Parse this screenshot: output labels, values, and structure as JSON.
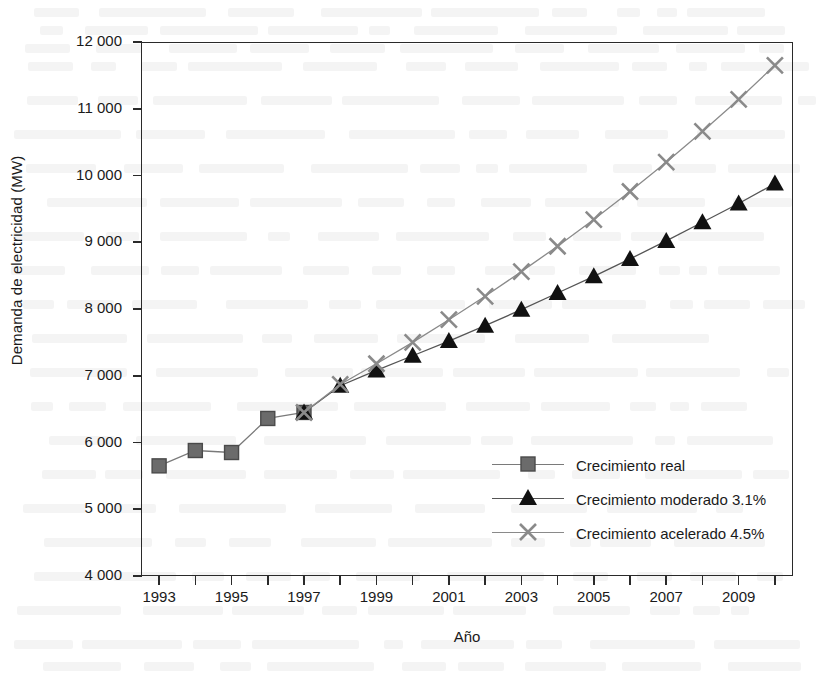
{
  "chart_data": {
    "type": "line",
    "title": "",
    "xlabel": "Año",
    "ylabel": "Demanda de electricidad (MW)",
    "xlim": [
      1992.5,
      2010.5
    ],
    "ylim": [
      4000,
      12000
    ],
    "grid": false,
    "legend_position": "inside-bottom-right",
    "y_ticks": [
      4000,
      5000,
      6000,
      7000,
      8000,
      9000,
      10000,
      11000,
      12000
    ],
    "y_tick_labels": [
      "4 000",
      "5 000",
      "6 000",
      "7 000",
      "8 000",
      "9 000",
      "10 000",
      "11 000",
      "12 000"
    ],
    "x_ticks": [
      1993,
      1994,
      1995,
      1996,
      1997,
      1998,
      1999,
      2000,
      2001,
      2002,
      2003,
      2004,
      2005,
      2006,
      2007,
      2008,
      2009,
      2010
    ],
    "x_tick_labels": [
      {
        "year": 1993,
        "label": "1993"
      },
      {
        "year": 1995,
        "label": "1995"
      },
      {
        "year": 1997,
        "label": "1997"
      },
      {
        "year": 1999,
        "label": "1999"
      },
      {
        "year": 2001,
        "label": "2001"
      },
      {
        "year": 2003,
        "label": "2003"
      },
      {
        "year": 2005,
        "label": "2005"
      },
      {
        "year": 2007,
        "label": "2007"
      },
      {
        "year": 2009,
        "label": "2009"
      }
    ],
    "series": [
      {
        "name": "Crecimiento real",
        "marker": "square",
        "color": "#6b6b6b",
        "line_color": "#7a7a7a",
        "x": [
          1993,
          1994,
          1995,
          1996,
          1997
        ],
        "values": [
          5650,
          5880,
          5850,
          6360,
          6450
        ]
      },
      {
        "name": "Crecimiento moderado 3.1%",
        "marker": "triangle",
        "color": "#111111",
        "line_color": "#555555",
        "x": [
          1997,
          1998,
          1999,
          2000,
          2001,
          2002,
          2003,
          2004,
          2005,
          2006,
          2007,
          2008,
          2009,
          2010
        ],
        "values": [
          6450,
          6850,
          7080,
          7300,
          7520,
          7750,
          7990,
          8240,
          8490,
          8750,
          9020,
          9300,
          9580,
          9880
        ]
      },
      {
        "name": "Crecimiento acelerado 4.5%",
        "marker": "x",
        "color": "#8a8a8a",
        "line_color": "#8a8a8a",
        "x": [
          1997,
          1998,
          1999,
          2000,
          2001,
          2002,
          2003,
          2004,
          2005,
          2006,
          2007,
          2008,
          2009,
          2010
        ],
        "values": [
          6450,
          6870,
          7180,
          7500,
          7840,
          8190,
          8560,
          8940,
          9340,
          9760,
          10200,
          10660,
          11140,
          11650
        ]
      }
    ]
  },
  "legend": {
    "entries": [
      {
        "label": "Crecimiento real"
      },
      {
        "label": "Crecimiento moderado 3.1%"
      },
      {
        "label": "Crecimiento acelerado 4.5%"
      }
    ]
  }
}
